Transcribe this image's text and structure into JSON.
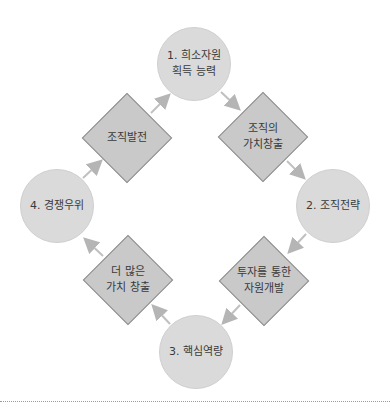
{
  "diagram": {
    "type": "cycle",
    "nodes": [
      {
        "id": "c1",
        "shape": "circle",
        "label": "1. 희소자원\n획득 능력",
        "cx": 194,
        "cy": 64
      },
      {
        "id": "d1",
        "shape": "diamond",
        "label": "조직의\n가치창출",
        "cx": 263,
        "cy": 137
      },
      {
        "id": "c2",
        "shape": "circle",
        "label": "2. 조직전략",
        "cx": 333,
        "cy": 206
      },
      {
        "id": "d2",
        "shape": "diamond",
        "label": "투자를 통한\n자원개발",
        "cx": 264,
        "cy": 281
      },
      {
        "id": "c3",
        "shape": "circle",
        "label": "3. 핵심역량",
        "cx": 196,
        "cy": 352
      },
      {
        "id": "d3",
        "shape": "diamond",
        "label": "더 많은\n가치 창출",
        "cx": 128,
        "cy": 280
      },
      {
        "id": "c4",
        "shape": "circle",
        "label": "4. 경쟁우위",
        "cx": 57,
        "cy": 206
      },
      {
        "id": "d4",
        "shape": "diamond",
        "label": "조직발전",
        "cx": 127,
        "cy": 138
      }
    ],
    "edges": [
      {
        "from": "c1",
        "to": "d1"
      },
      {
        "from": "d1",
        "to": "c2"
      },
      {
        "from": "c2",
        "to": "d2"
      },
      {
        "from": "d2",
        "to": "c3"
      },
      {
        "from": "c3",
        "to": "d3"
      },
      {
        "from": "d3",
        "to": "c4"
      },
      {
        "from": "c4",
        "to": "d4"
      },
      {
        "from": "d4",
        "to": "c1"
      }
    ],
    "colors": {
      "circle_fill": "#dadada",
      "diamond_fill": "#c9c9c9",
      "diamond_border": "#8f8f8f",
      "arrow": "#b5b5b5",
      "text": "#3a3a3a"
    }
  }
}
